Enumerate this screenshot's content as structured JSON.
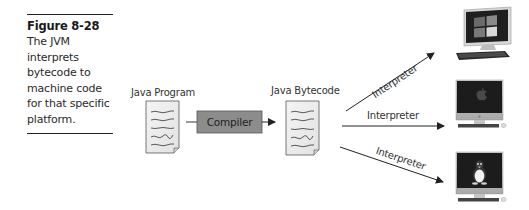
{
  "caption": {
    "figure_number": "Figure 8-28",
    "text": "The JVM interprets bytecode to machine code for that specific platform."
  },
  "diagram": {
    "source": {
      "label": "Java Program",
      "icon": "document-icon"
    },
    "compiler": {
      "label": "Compiler",
      "fill": "#8c8c8c"
    },
    "output": {
      "label": "Java Bytecode",
      "icon": "document-icon"
    },
    "arrows": [
      {
        "label": "Interpreter",
        "target": "windows-pc"
      },
      {
        "label": "Interpreter",
        "target": "mac"
      },
      {
        "label": "Interpreter",
        "target": "linux-pc"
      }
    ],
    "platforms": [
      {
        "name": "windows-pc",
        "icon": "windows-logo-icon"
      },
      {
        "name": "mac",
        "icon": "apple-logo-icon"
      },
      {
        "name": "linux-pc",
        "icon": "tux-penguin-icon"
      }
    ]
  }
}
